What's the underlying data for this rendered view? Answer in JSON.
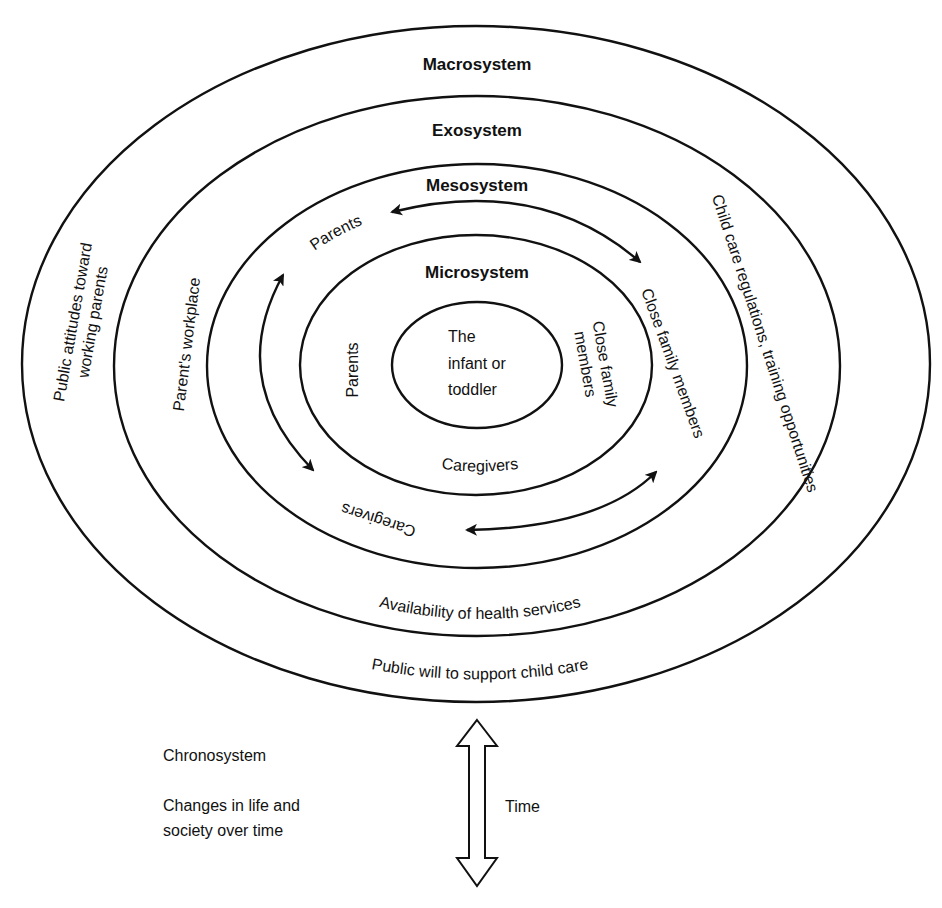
{
  "diagram": {
    "systems": {
      "macrosystem": {
        "title": "Macrosystem",
        "labels": {
          "left": [
            "Public attitudes toward",
            "working parents"
          ],
          "bottom": "Public will to support child care"
        }
      },
      "exosystem": {
        "title": "Exosystem",
        "labels": {
          "left": "Parent's workplace",
          "right": "Child care regulations, training opportunities",
          "bottom": "Availability of health services"
        }
      },
      "mesosystem": {
        "title": "Mesosystem",
        "labels": {
          "top_left": "Parents",
          "right": "Close family members",
          "bottom": "Caregivers"
        }
      },
      "microsystem": {
        "title": "Microsystem",
        "labels": {
          "left": "Parents",
          "right": [
            "Close family",
            "members"
          ],
          "bottom": "Caregivers"
        }
      },
      "center": {
        "lines": [
          "The",
          "infant or",
          "toddler"
        ]
      }
    },
    "chronosystem": {
      "title": "Chronosystem",
      "description": [
        "Changes in life and",
        "society over time"
      ],
      "arrow_label": "Time"
    },
    "colors": {
      "stroke": "#111111",
      "background": "#ffffff"
    }
  }
}
